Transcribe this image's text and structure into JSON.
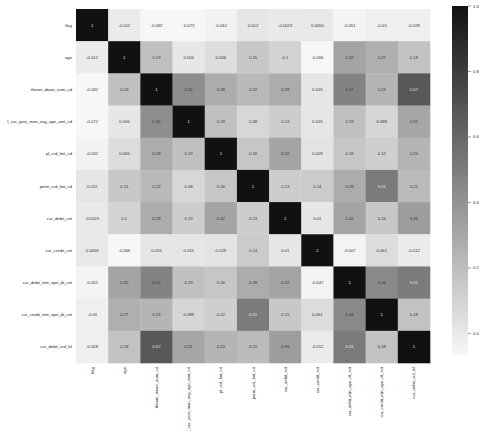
{
  "chart_data": {
    "type": "heatmap",
    "title": "",
    "xlabel": "",
    "ylabel": "",
    "labels": [
      "flag",
      "age",
      "thmon_dawn_aum_cd",
      "f_cur_year_mon_avg_agn_amt_cd",
      "pl_crd_lmt_cd",
      "perm_crd_lmt_cd",
      "cur_debit_cnt",
      "cur_credit_cnt",
      "cur_debit_min_opn_dt_cnt",
      "cur_credit_min_opn_dt_cnt",
      "cur_debit_crd_lvl"
    ],
    "matrix": [
      [
        1,
        -0.012,
        -0.092,
        -0.072,
        -0.042,
        0.012,
        -0.0023,
        0.0056,
        -0.051,
        -0.03,
        -0.028
      ],
      [
        -0.012,
        1,
        0.19,
        0.006,
        0.056,
        0.15,
        0.1,
        -0.066,
        0.32,
        0.27,
        0.18
      ],
      [
        -0.092,
        0.19,
        1,
        0.42,
        0.28,
        0.22,
        0.28,
        0.015,
        0.47,
        0.24,
        0.67
      ],
      [
        -0.072,
        0.006,
        0.42,
        1,
        0.19,
        0.08,
        0.13,
        0.015,
        0.19,
        0.088,
        0.31
      ],
      [
        -0.042,
        0.056,
        0.28,
        0.19,
        1,
        0.16,
        0.32,
        0.029,
        0.16,
        0.12,
        0.24
      ],
      [
        0.012,
        0.15,
        0.22,
        0.08,
        0.16,
        1,
        0.13,
        0.14,
        0.28,
        0.51,
        0.21
      ],
      [
        -0.0023,
        0.1,
        0.28,
        0.13,
        0.32,
        0.13,
        1,
        0.01,
        0.32,
        0.15,
        0.35
      ],
      [
        0.0056,
        -0.066,
        0.015,
        0.015,
        0.029,
        0.14,
        0.01,
        1,
        -0.047,
        0.061,
        -0.012
      ],
      [
        -0.051,
        0.32,
        0.47,
        0.19,
        0.16,
        0.28,
        0.32,
        -0.047,
        1,
        0.44,
        0.51
      ],
      [
        -0.03,
        0.27,
        0.24,
        0.088,
        0.12,
        0.51,
        0.15,
        0.061,
        0.44,
        1,
        0.18
      ],
      [
        -0.028,
        0.18,
        0.67,
        0.31,
        0.24,
        0.21,
        0.35,
        -0.012,
        0.51,
        0.18,
        1
      ]
    ],
    "display_values": [
      [
        "1",
        "-0.012",
        "-0.092",
        "-0.072",
        "-0.042",
        "0.012",
        "-0.0023",
        "0.0056",
        "-0.051",
        "-0.03",
        "-0.028"
      ],
      [
        "-0.012",
        "1",
        "0.19",
        "0.006",
        "0.056",
        "0.15",
        "0.1",
        "-0.066",
        "0.32",
        "0.27",
        "0.18"
      ],
      [
        "-0.092",
        "0.19",
        "1",
        "0.42",
        "0.28",
        "0.22",
        "0.28",
        "0.015",
        "0.47",
        "0.24",
        "0.67"
      ],
      [
        "-0.072",
        "0.006",
        "0.42",
        "1",
        "0.19",
        "0.08",
        "0.13",
        "0.015",
        "0.19",
        "0.088",
        "0.31"
      ],
      [
        "-0.042",
        "0.056",
        "0.28",
        "0.19",
        "1",
        "0.16",
        "0.32",
        "0.029",
        "0.16",
        "0.12",
        "0.24"
      ],
      [
        "0.012",
        "0.15",
        "0.22",
        "0.08",
        "0.16",
        "1",
        "0.13",
        "0.14",
        "0.28",
        "0.51",
        "0.21"
      ],
      [
        "-0.0023",
        "0.1",
        "0.28",
        "0.13",
        "0.32",
        "0.13",
        "1",
        "0.01",
        "0.32",
        "0.15",
        "0.35"
      ],
      [
        "0.0056",
        "-0.066",
        "0.015",
        "0.015",
        "0.029",
        "0.14",
        "0.01",
        "1",
        "-0.047",
        "0.061",
        "-0.012"
      ],
      [
        "-0.051",
        "0.32",
        "0.47",
        "0.19",
        "0.16",
        "0.28",
        "0.32",
        "-0.047",
        "1",
        "0.44",
        "0.51"
      ],
      [
        "-0.03",
        "0.27",
        "0.24",
        "0.088",
        "0.12",
        "0.51",
        "0.15",
        "0.061",
        "0.44",
        "1",
        "0.18"
      ],
      [
        "-0.028",
        "0.18",
        "0.67",
        "0.31",
        "0.24",
        "0.21",
        "0.35",
        "-0.012",
        "0.51",
        "0.18",
        "1"
      ]
    ],
    "colorbar": {
      "vmin": -0.066,
      "vmax": 1.0,
      "ticks": [
        1.0,
        0.8,
        0.6,
        0.4,
        0.2,
        0.0
      ],
      "tick_labels": [
        "1.0",
        "0.8",
        "0.6",
        "0.4",
        "0.2",
        "0.0"
      ],
      "colormap": "greys",
      "low_color": "#f7f7f7",
      "high_color": "#111111"
    },
    "annotations": true,
    "grid": false,
    "legend_position": "right"
  }
}
